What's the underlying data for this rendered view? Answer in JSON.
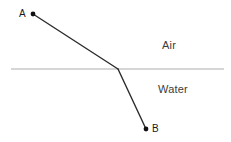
{
  "figure": {
    "width": 231,
    "height": 142,
    "background_color": "#ffffff"
  },
  "labels": {
    "air": "Air",
    "water": "Water",
    "point_a": "A",
    "point_b": "B"
  },
  "colors": {
    "ray": "#2b2b2b",
    "interface_line": "#c9c9c9",
    "point_marker": "#111111",
    "text": "#3b3b3b"
  },
  "geometry": {
    "interface_line": {
      "x1": 11,
      "y1": 69,
      "x2": 224,
      "y2": 69
    },
    "point_a": {
      "x": 33,
      "y": 14,
      "radius": 2.4
    },
    "incidence_point": {
      "x": 118,
      "y": 69
    },
    "point_b": {
      "x": 146,
      "y": 129,
      "radius": 2.4
    },
    "incident_ray": {
      "x1": 33,
      "y1": 14,
      "x2": 118,
      "y2": 69
    },
    "refracted_ray": {
      "x1": 118,
      "y1": 69,
      "x2": 146,
      "y2": 129
    },
    "ray_stroke_width": 1.4,
    "interface_stroke_width": 1.6
  },
  "chart_data": {
    "type": "line",
    "xlabel": "",
    "ylabel": "",
    "xlim": [
      0,
      231
    ],
    "ylim": [
      142,
      0
    ],
    "grid": false,
    "legend": "none",
    "annotations": [
      {
        "text": "A",
        "x": 22,
        "y": 14
      },
      {
        "text": "B",
        "x": 155,
        "y": 129
      },
      {
        "text": "Air",
        "x": 174,
        "y": 46
      },
      {
        "text": "Water",
        "x": 176,
        "y": 90
      }
    ],
    "series": [
      {
        "name": "light-ray",
        "x": [
          33,
          118,
          146
        ],
        "y": [
          14,
          69,
          129
        ]
      },
      {
        "name": "air-water-interface",
        "x": [
          11,
          224
        ],
        "y": [
          69,
          69
        ]
      }
    ],
    "points": [
      {
        "name": "A",
        "x": 33,
        "y": 14
      },
      {
        "name": "B",
        "x": 146,
        "y": 129
      }
    ]
  }
}
